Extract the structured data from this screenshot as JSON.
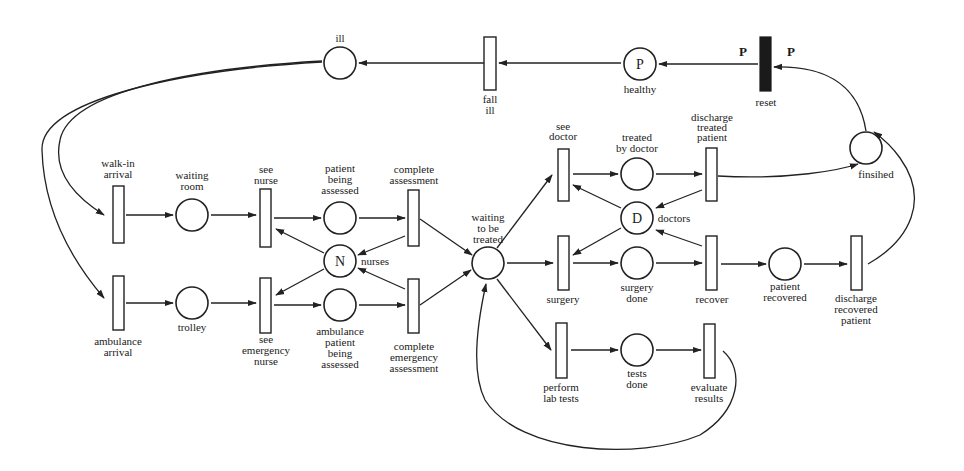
{
  "diagram": {
    "type": "petri-net",
    "colors": {
      "stroke": "#222222",
      "background": "#ffffff",
      "reset_transition": "#1a1a1a"
    },
    "places": {
      "ill": {
        "label": "ill",
        "token": ""
      },
      "healthy": {
        "label": "healthy",
        "token": "P"
      },
      "finished": {
        "label": "finsihed",
        "token": ""
      },
      "waiting_room": {
        "label_1": "waiting",
        "label_2": "room"
      },
      "patient_being_assessed": {
        "label_1": "patient",
        "label_2": "being",
        "label_3": "assessed"
      },
      "nurses": {
        "label": "nurses",
        "token": "N"
      },
      "trolley": {
        "label": "trolley"
      },
      "ambulance_patient_being_assessed": {
        "label_1": "ambulance",
        "label_2": "patient",
        "label_3": "being",
        "label_4": "assessed"
      },
      "waiting_to_be_treated": {
        "label_1": "waiting",
        "label_2": "to be",
        "label_3": "treated"
      },
      "treated_by_doctor": {
        "label_1": "treated",
        "label_2": "by doctor"
      },
      "doctors": {
        "label": "doctors",
        "token": "D"
      },
      "surgery_done": {
        "label_1": "surgery",
        "label_2": "done"
      },
      "patient_recovered": {
        "label_1": "patient",
        "label_2": "recovered"
      },
      "tests_done": {
        "label_1": "tests",
        "label_2": "done"
      }
    },
    "transitions": {
      "fall_ill": {
        "label_1": "fall",
        "label_2": "ill"
      },
      "reset": {
        "label": "reset",
        "weight_in": "P",
        "weight_out": "P"
      },
      "walk_in_arrival": {
        "label_1": "walk-in",
        "label_2": "arrival"
      },
      "see_nurse": {
        "label_1": "see",
        "label_2": "nurse"
      },
      "complete_assessment": {
        "label_1": "complete",
        "label_2": "assessment"
      },
      "ambulance_arrival": {
        "label_1": "ambulance",
        "label_2": "arrival"
      },
      "see_emergency_nurse": {
        "label_1": "see",
        "label_2": "emergency",
        "label_3": "nurse"
      },
      "complete_emergency_assessment": {
        "label_1": "complete",
        "label_2": "emergency",
        "label_3": "assessment"
      },
      "see_doctor": {
        "label_1": "see",
        "label_2": "doctor"
      },
      "discharge_treated_patient": {
        "label_1": "discharge",
        "label_2": "treated",
        "label_3": "patient"
      },
      "surgery": {
        "label": "surgery"
      },
      "recover": {
        "label": "recover"
      },
      "discharge_recovered_patient": {
        "label_1": "discharge",
        "label_2": "recovered",
        "label_3": "patient"
      },
      "perform_lab_tests": {
        "label_1": "perform",
        "label_2": "lab tests"
      },
      "evaluate_results": {
        "label_1": "evaluate",
        "label_2": "results"
      }
    }
  }
}
